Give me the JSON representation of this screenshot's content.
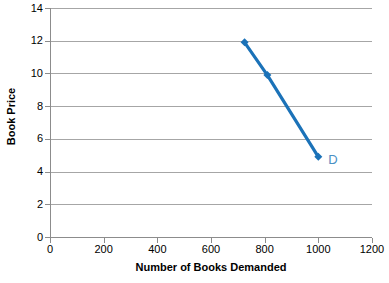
{
  "chart_data": {
    "type": "line",
    "title": "",
    "subtitle": "",
    "xlabel": "Number of Books Demanded",
    "ylabel": "Book Price",
    "xlim": [
      0,
      1200
    ],
    "ylim": [
      0,
      14
    ],
    "xticks": [
      "0",
      "200",
      "400",
      "600",
      "800",
      "1000",
      "1200"
    ],
    "xtick_values": [
      0,
      200,
      400,
      600,
      800,
      1000,
      1200
    ],
    "yticks": [
      "0",
      "2",
      "4",
      "6",
      "8",
      "10",
      "12",
      "14"
    ],
    "ytick_values": [
      0,
      2,
      4,
      6,
      8,
      10,
      12,
      14
    ],
    "grid": "horizontal",
    "legend_position": "inline-right-of-last-point",
    "series": [
      {
        "name": "D",
        "color": "#1b72b8",
        "marker": "diamond",
        "x": [
          725,
          810,
          1000
        ],
        "y": [
          11.9,
          9.9,
          4.9
        ],
        "annotation": "D",
        "annotation_color": "#4a90c4"
      }
    ]
  },
  "colors": {
    "series_blue": "#1b72b8",
    "annotation_blue": "#4a90c4",
    "gridline": "#a6a6a6",
    "axis": "#8c8c8c",
    "background": "#ffffff",
    "text": "#000000"
  }
}
